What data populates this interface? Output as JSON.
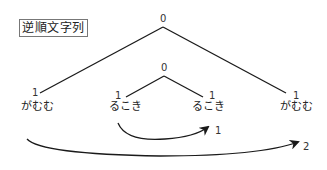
{
  "title": "逆順文字列",
  "tree": {
    "root": {
      "label": "0"
    },
    "left_leaf": {
      "count": "1",
      "word": "がむむ"
    },
    "inner": {
      "label": "0",
      "left": {
        "count": "1",
        "word": "るこき"
      },
      "right": {
        "count": "1",
        "word": "るこき"
      }
    },
    "right_leaf": {
      "count": "1",
      "word": "がむむ"
    }
  },
  "arrows": [
    {
      "id": "inner-swap",
      "label": "1"
    },
    {
      "id": "outer-swap",
      "label": "2"
    }
  ],
  "colors": {
    "line": "#1a1a1a",
    "text": "#222222",
    "border": "#777777"
  }
}
